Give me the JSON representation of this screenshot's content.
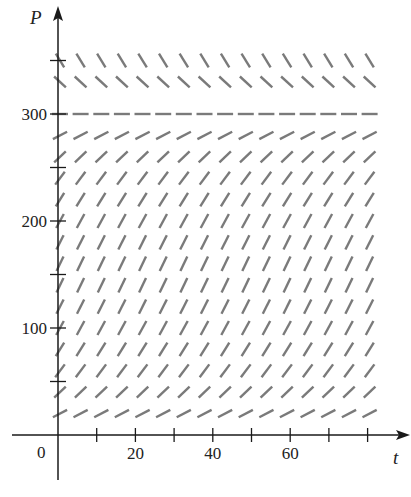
{
  "chart_data": {
    "type": "direction-field",
    "title": "",
    "equation": "dP/dt = k P (1 - P/300)",
    "xlabel": "t",
    "ylabel": "P",
    "origin_label": "0",
    "x_ticks": [
      10,
      20,
      30,
      40,
      50,
      60,
      70,
      80
    ],
    "x_tick_labels": [
      {
        "value": 20,
        "label": "20"
      },
      {
        "value": 40,
        "label": "40"
      },
      {
        "value": 60,
        "label": "60"
      }
    ],
    "y_ticks": [
      50,
      100,
      150,
      200,
      250,
      300,
      350
    ],
    "y_tick_labels": [
      {
        "value": 100,
        "label": "100"
      },
      {
        "value": 200,
        "label": "200"
      },
      {
        "value": 300,
        "label": "300"
      }
    ],
    "xlim": [
      0,
      80
    ],
    "ylim": [
      0,
      360
    ],
    "equilibrium": 300,
    "grid": false,
    "columns_t": [
      0,
      5.33,
      10.67,
      16,
      21.33,
      26.67,
      32,
      37.33,
      42.67,
      48,
      53.33,
      58.67,
      64,
      69.33,
      74.67,
      80
    ],
    "rows_P": [
      20,
      40,
      60,
      80,
      100,
      120,
      140,
      160,
      180,
      200,
      220,
      240,
      260,
      280,
      300,
      330,
      350
    ],
    "k": 0.1,
    "segment_color": "#7a7a7a",
    "axis_color": "#1a1a1a"
  }
}
